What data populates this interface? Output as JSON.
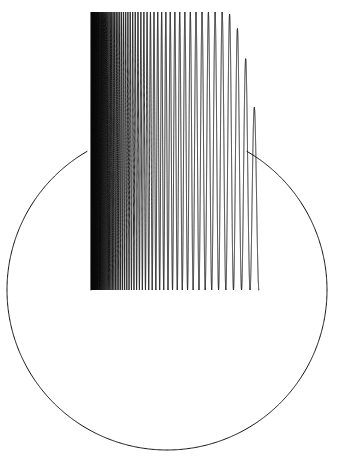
{
  "figure": {
    "title": "",
    "background_color": "#ffffff",
    "stroke_color": "#111111",
    "width": 344,
    "height": 464,
    "alt_text": "Line drawing of a circle with a high-frequency oscillating chirp curve overlaid on its upper-left region"
  },
  "chart_data": {
    "type": "line",
    "title": "",
    "subtitle": "",
    "xlabel": "",
    "ylabel": "",
    "xlim": [
      -1.05,
      1.05
    ],
    "ylim": [
      -1.05,
      1.05
    ],
    "grid": false,
    "legend": "none",
    "axes_visible": false,
    "tick_labels_x": [],
    "tick_labels_y": [],
    "annotations": [],
    "series": [
      {
        "name": "circle",
        "kind": "parametric-circle",
        "description": "Unit circle arc drawn from angle 120 degrees counterclockwise through 360 degrees to angle 60 degrees",
        "center_px": [
          167,
          290
        ],
        "radius_px": 160,
        "start_angle_deg": 120,
        "end_angle_deg": 420,
        "stroke": "#111111",
        "stroke_width": 1
      },
      {
        "name": "chirp",
        "kind": "frequency-sweep",
        "description": "Oscillation whose frequency increases sharply toward the left, producing a solid black band; amplitude decays and the final lobes are individually resolvable",
        "x_start_px": 91,
        "x_end_px": 259,
        "y_top_px": 12,
        "y_baseline_px": 290,
        "peak_px": [
          157,
          15
        ],
        "valley_px": [
          203,
          288
        ],
        "right_peak_px": [
          259,
          152
        ],
        "dense_band_left_px": 91,
        "dense_band_right_px": 112,
        "stroke": "#0a0a0a",
        "stroke_width": 0.9,
        "num_oscillations": 64
      }
    ]
  }
}
